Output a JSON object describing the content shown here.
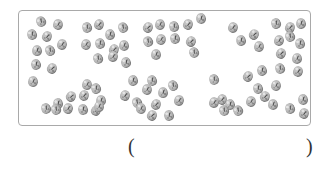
{
  "figure": {
    "seed_count": 72,
    "border_color": "#a9a9a9",
    "seed_color": "#b3b3b3",
    "seeds": [
      [
        41,
        21
      ],
      [
        58,
        24
      ],
      [
        32,
        34
      ],
      [
        47,
        36
      ],
      [
        37,
        50
      ],
      [
        50,
        50
      ],
      [
        62,
        44
      ],
      [
        36,
        64
      ],
      [
        52,
        68
      ],
      [
        33,
        81
      ],
      [
        87,
        27
      ],
      [
        99,
        24
      ],
      [
        110,
        34
      ],
      [
        123,
        27
      ],
      [
        86,
        44
      ],
      [
        100,
        43
      ],
      [
        114,
        49
      ],
      [
        124,
        45
      ],
      [
        98,
        58
      ],
      [
        113,
        56
      ],
      [
        126,
        62
      ],
      [
        148,
        27
      ],
      [
        160,
        24
      ],
      [
        174,
        26
      ],
      [
        188,
        24
      ],
      [
        201,
        18
      ],
      [
        148,
        41
      ],
      [
        161,
        39
      ],
      [
        175,
        38
      ],
      [
        191,
        41
      ],
      [
        156,
        54
      ],
      [
        194,
        52
      ],
      [
        233,
        27
      ],
      [
        241,
        40
      ],
      [
        254,
        34
      ],
      [
        259,
        46
      ],
      [
        276,
        23
      ],
      [
        290,
        27
      ],
      [
        301,
        23
      ],
      [
        290,
        36
      ],
      [
        279,
        40
      ],
      [
        300,
        43
      ],
      [
        281,
        53
      ],
      [
        297,
        58
      ],
      [
        280,
        68
      ],
      [
        298,
        71
      ],
      [
        58,
        103
      ],
      [
        71,
        96
      ],
      [
        87,
        84
      ],
      [
        96,
        88
      ],
      [
        84,
        95
      ],
      [
        101,
        100
      ],
      [
        56,
        109
      ],
      [
        68,
        108
      ],
      [
        83,
        109
      ],
      [
        96,
        110
      ],
      [
        99,
        106
      ],
      [
        46,
        108
      ],
      [
        125,
        95
      ],
      [
        133,
        80
      ],
      [
        137,
        102
      ],
      [
        147,
        89
      ],
      [
        152,
        80
      ],
      [
        156,
        104
      ],
      [
        163,
        92
      ],
      [
        173,
        85
      ],
      [
        179,
        100
      ],
      [
        169,
        115
      ],
      [
        152,
        115
      ],
      [
        141,
        108
      ],
      [
        214,
        79
      ],
      [
        222,
        99
      ],
      [
        230,
        104
      ],
      [
        238,
        110
      ],
      [
        251,
        101
      ],
      [
        258,
        88
      ],
      [
        265,
        96
      ],
      [
        273,
        104
      ],
      [
        224,
        110
      ],
      [
        214,
        102
      ],
      [
        262,
        70
      ],
      [
        248,
        76
      ],
      [
        276,
        85
      ],
      [
        290,
        108
      ],
      [
        304,
        113
      ],
      [
        303,
        99
      ]
    ]
  },
  "answer": {
    "open_paren": "(",
    "close_paren": ")",
    "value": ""
  }
}
